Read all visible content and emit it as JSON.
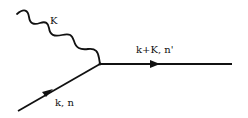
{
  "diagram": {
    "type": "feynman-vertex",
    "colors": {
      "line": "#111111",
      "background": "#ffffff"
    },
    "lines": {
      "photon": {
        "kind": "wavy",
        "label": "K"
      },
      "outgoing": {
        "kind": "fermion",
        "label": "k+K, n'"
      },
      "incoming": {
        "kind": "fermion",
        "label": "k, n"
      }
    }
  }
}
